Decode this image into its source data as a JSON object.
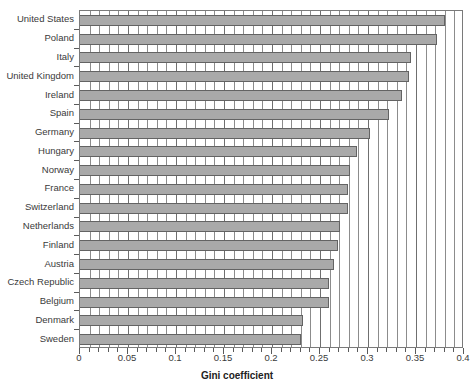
{
  "chart_data": {
    "type": "bar",
    "orientation": "horizontal",
    "title": "",
    "xlabel": "Gini coefficient",
    "ylabel": "",
    "xlim": [
      0,
      0.4
    ],
    "ylim": null,
    "grid": true,
    "legend": null,
    "xticks": [
      "0",
      "0.05",
      "0.1",
      "0.15",
      "0.2",
      "0.25",
      "0.3",
      "0.35",
      "0.4"
    ],
    "xtick_values": [
      0,
      0.05,
      0.1,
      0.15,
      0.2,
      0.25,
      0.3,
      0.35,
      0.4
    ],
    "minor_tick_step": 0.01,
    "bar_color": "#a9a9a9",
    "bar_edge_color": "#636363",
    "categories": [
      "United States",
      "Poland",
      "Italy",
      "United Kingdom",
      "Ireland",
      "Spain",
      "Germany",
      "Hungary",
      "Norway",
      "France",
      "Switzerland",
      "Netherlands",
      "Finland",
      "Austria",
      "Czech Republic",
      "Belgium",
      "Denmark",
      "Sweden"
    ],
    "values": [
      0.38,
      0.372,
      0.345,
      0.343,
      0.335,
      0.322,
      0.302,
      0.289,
      0.281,
      0.279,
      0.279,
      0.271,
      0.269,
      0.265,
      0.259,
      0.259,
      0.232,
      0.23
    ]
  }
}
